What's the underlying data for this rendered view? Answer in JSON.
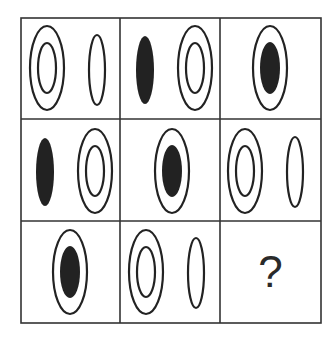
{
  "puzzle": {
    "type": "3x3 matrix reasoning",
    "grid": {
      "rows": 3,
      "cols": 3,
      "line_color": "#333333",
      "fill_color": "#222222"
    },
    "cells": [
      {
        "row": 1,
        "col": 1,
        "figures": [
          "double-ring",
          "single-ellipse"
        ]
      },
      {
        "row": 1,
        "col": 2,
        "figures": [
          "filled-ellipse",
          "double-ring"
        ]
      },
      {
        "row": 1,
        "col": 3,
        "figures": [
          "ring-with-filled-center"
        ]
      },
      {
        "row": 2,
        "col": 1,
        "figures": [
          "filled-ellipse",
          "double-ring"
        ]
      },
      {
        "row": 2,
        "col": 2,
        "figures": [
          "ring-with-filled-center"
        ]
      },
      {
        "row": 2,
        "col": 3,
        "figures": [
          "double-ring",
          "single-ellipse"
        ]
      },
      {
        "row": 3,
        "col": 1,
        "figures": [
          "ring-with-filled-center"
        ]
      },
      {
        "row": 3,
        "col": 2,
        "figures": [
          "double-ring",
          "single-ellipse"
        ]
      },
      {
        "row": 3,
        "col": 3,
        "figures": [],
        "label": "?"
      }
    ],
    "missing_label": "?"
  }
}
